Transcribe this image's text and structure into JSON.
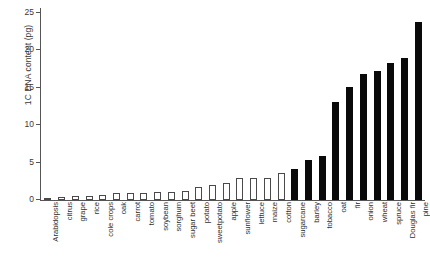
{
  "chart_data": {
    "type": "bar",
    "title": "",
    "subtitle": "",
    "xlabel": "",
    "ylabel": "1C DNA content (pg)",
    "ylim": [
      0,
      25
    ],
    "yticks": [
      0,
      5,
      10,
      15,
      20,
      25
    ],
    "ytick_labels": [
      "0",
      "5",
      "10",
      "15",
      "20",
      "25"
    ],
    "grid": false,
    "legend": null,
    "legend_position": "none",
    "bar_style_note": "first 18 bars drawn hollow (white fill, dark outline); remaining 10 bars solid black",
    "categories": [
      "Arabidopsis",
      "citrus",
      "grape",
      "rice",
      "cole crops",
      "oak",
      "carrot",
      "tomato",
      "soybean",
      "sorghum",
      "sugar beet",
      "potato",
      "sweetpotato",
      "apple",
      "sunflower",
      "lettuce",
      "maize",
      "cotton",
      "sugarcane",
      "barley",
      "tobacco",
      "oat",
      "fir",
      "onion",
      "wheat",
      "spruce",
      "Douglas fir",
      "pine"
    ],
    "values": [
      0.15,
      0.4,
      0.5,
      0.5,
      0.7,
      0.9,
      0.95,
      1.0,
      1.1,
      1.1,
      1.2,
      1.7,
      2.0,
      2.3,
      2.9,
      3.0,
      3.0,
      3.6,
      4.2,
      5.4,
      5.9,
      13.1,
      15.1,
      16.9,
      17.3,
      18.3,
      19.0,
      23.8
    ],
    "fills": [
      "hollow",
      "hollow",
      "hollow",
      "hollow",
      "hollow",
      "hollow",
      "hollow",
      "hollow",
      "hollow",
      "hollow",
      "hollow",
      "hollow",
      "hollow",
      "hollow",
      "hollow",
      "hollow",
      "hollow",
      "hollow",
      "solid",
      "solid",
      "solid",
      "solid",
      "solid",
      "solid",
      "solid",
      "solid",
      "solid",
      "solid"
    ],
    "colors": {
      "solid_bar": "#0a0a0a",
      "hollow_bar_fill": "#ffffff",
      "hollow_bar_outline": "#4a4a4a",
      "axis": "#555555",
      "text": "#2f2f2f",
      "background": "#ffffff"
    }
  }
}
